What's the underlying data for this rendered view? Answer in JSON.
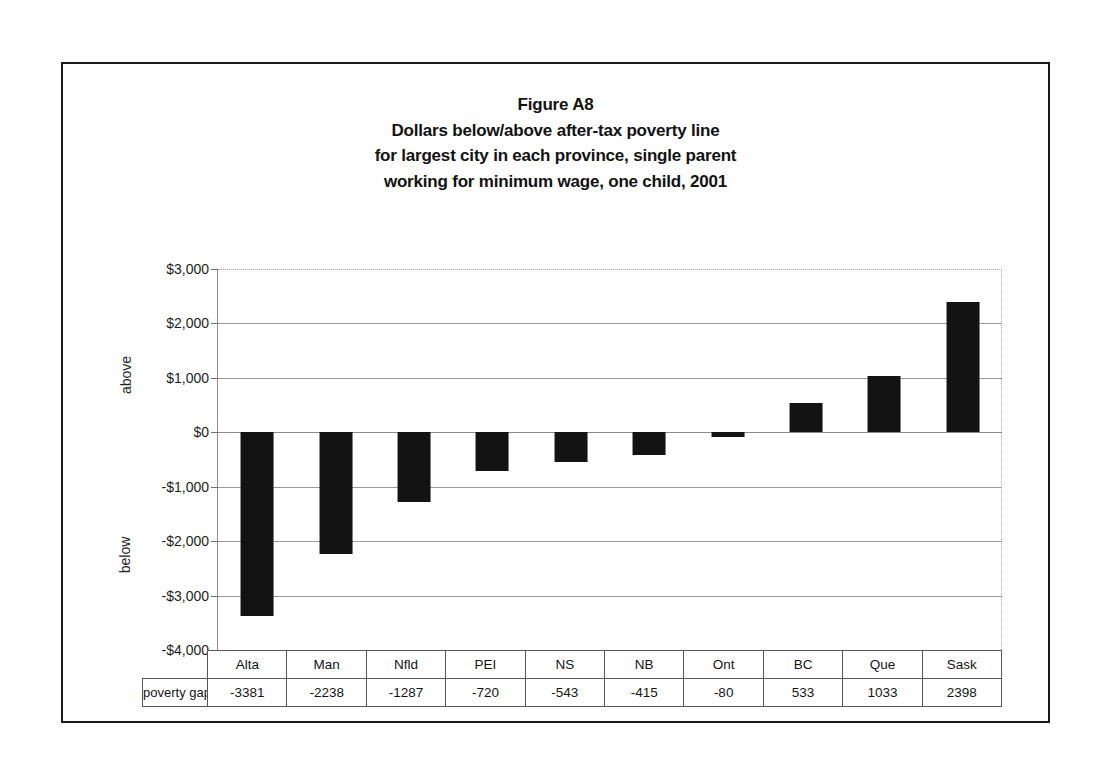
{
  "figure": {
    "title_lines": [
      "Figure A8",
      "Dollars below/above after-tax poverty line",
      "for largest city in each province, single parent",
      "working for minimum wage, one child, 2001"
    ],
    "axis_side_labels": {
      "above": "above",
      "below": "below"
    },
    "table_row_label": "poverty gap"
  },
  "chart_data": {
    "type": "bar",
    "xlabel": "",
    "ylabel": "",
    "categories": [
      "Alta",
      "Man",
      "Nfld",
      "PEI",
      "NS",
      "NB",
      "Ont",
      "BC",
      "Que",
      "Sask"
    ],
    "values": [
      -3381,
      -2238,
      -1287,
      -720,
      -543,
      -415,
      -80,
      533,
      1033,
      2398
    ],
    "series": [
      {
        "name": "poverty gap",
        "values": [
          -3381,
          -2238,
          -1287,
          -720,
          -543,
          -415,
          -80,
          533,
          1033,
          2398
        ]
      }
    ],
    "ylim": [
      -4000,
      3000
    ],
    "ytick_values": [
      3000,
      2000,
      1000,
      0,
      -1000,
      -2000,
      -3000,
      -4000
    ],
    "ytick_labels": [
      "$3,000",
      "$2,000",
      "$1,000",
      "$0",
      "-$1,000",
      "-$2,000",
      "-$3,000",
      "-$4,000"
    ],
    "grid": true,
    "legend": false,
    "bar_color": "#131313",
    "value_labels": [
      "-3381",
      "-2238",
      "-1287",
      "-720",
      "-543",
      "-415",
      "-80",
      "533",
      "1033",
      "2398"
    ]
  }
}
